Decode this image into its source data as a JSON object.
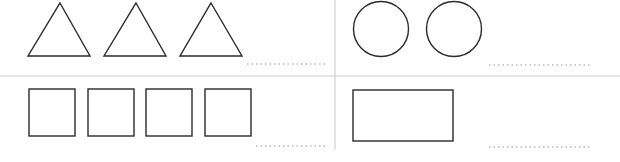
{
  "worksheet": {
    "panels": [
      {
        "id": "triangles",
        "shape": "triangle",
        "count": 3,
        "answer": ""
      },
      {
        "id": "circles",
        "shape": "circle",
        "count": 2,
        "answer": ""
      },
      {
        "id": "squares",
        "shape": "square",
        "count": 4,
        "answer": ""
      },
      {
        "id": "rectangle",
        "shape": "rectangle",
        "count": 1,
        "answer": ""
      }
    ],
    "colors": {
      "stroke": "#2a2a2a",
      "divider": "#d0d0d0",
      "dots": "#b8b8b8"
    }
  }
}
